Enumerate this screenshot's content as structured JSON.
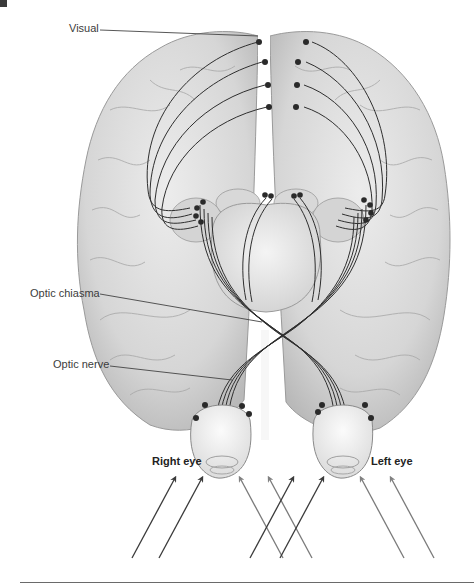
{
  "figure": {
    "labels": {
      "visual": "Visual",
      "optic_chiasma": "Optic chiasma",
      "optic_nerve": "Optic nerve",
      "right_eye": "Right eye",
      "left_eye": "Left eye"
    },
    "colors": {
      "brain_fill": "#dcdcdc",
      "brain_shadow": "#b8b8b8",
      "nerve_line": "#2e2e2e",
      "dot": "#2a2a2a",
      "arrow_dark": "#3a3a3a",
      "arrow_gray": "#7a7a7a",
      "leader_line": "#444444"
    },
    "light_rays": [
      {
        "side": "left-group",
        "shade": "dark",
        "count": 2
      },
      {
        "side": "center-group",
        "shade": "gray",
        "count": 2
      },
      {
        "side": "center-group",
        "shade": "dark",
        "count": 2
      },
      {
        "side": "right-group",
        "shade": "gray",
        "count": 2
      }
    ]
  }
}
